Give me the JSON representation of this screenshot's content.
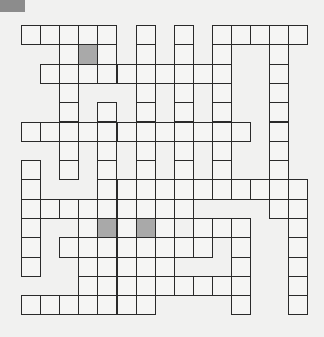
{
  "puzzle": {
    "type": "crossword-grid",
    "cols": 15,
    "rows": 15,
    "cell_w": 19.1,
    "cell_h": 19.3,
    "colors": {
      "background": "#f1f1f0",
      "cell": "#f5f5f4",
      "shaded": "#a9a9a9",
      "border": "#2a2a2a",
      "corner": "#8c8c8c"
    },
    "layout": [
      "111110101011111",
      "001g10101010010",
      "011111111110010",
      "001000101010010",
      "001010101010010",
      "111111111111010",
      "001010101010010",
      "101010101010010",
      "100011111111111",
      "111111111000011",
      "1001g1g10111001",
      "101111111101001",
      "100111110001001",
      "000111111111001",
      "111111100001001"
    ]
  }
}
